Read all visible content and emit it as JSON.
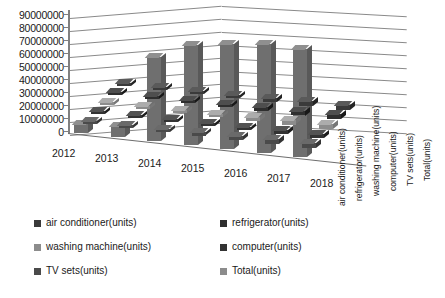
{
  "chart_data": {
    "type": "bar",
    "title": "",
    "subtitle": "",
    "xlabel": "",
    "ylabel": "",
    "zlabel": "",
    "categories": [
      "2012",
      "2013",
      "2014",
      "2015",
      "2016",
      "2017",
      "2018"
    ],
    "ylim": [
      0,
      90000000
    ],
    "ytick_step": 10000000,
    "yticks": [
      "90000000",
      "80000000",
      "70000000",
      "60000000",
      "50000000",
      "40000000",
      "30000000",
      "20000000",
      "10000000",
      "0"
    ],
    "grid": true,
    "legend_position": "bottom",
    "three_d": true,
    "depth_axis_labels": [
      "air conditioner(units)",
      "refrigerator(units)",
      "washing machine(units)",
      "computer(units)",
      "TV sets(units)",
      "Total(units)"
    ],
    "series": [
      {
        "name": "air conditioner(units)",
        "color": "#3a3a3a",
        "values": [
          1200000,
          1500000,
          1900000,
          2300000,
          2800000,
          3400000,
          3900000
        ]
      },
      {
        "name": "refrigerator(units)",
        "color": "#2e2e2e",
        "values": [
          1500000,
          1800000,
          2200000,
          2600000,
          3000000,
          3500000,
          3800000
        ]
      },
      {
        "name": "washing machine(units)",
        "color": "#8c8c8c",
        "values": [
          1300000,
          1600000,
          2000000,
          2400000,
          2900000,
          3300000,
          3600000
        ]
      },
      {
        "name": "computer(units)",
        "color": "#333333",
        "values": [
          1100000,
          1400000,
          1800000,
          2100000,
          2500000,
          2900000,
          3200000
        ]
      },
      {
        "name": "TV sets(units)",
        "color": "#4a4a4a",
        "values": [
          1400000,
          1700000,
          2100000,
          2500000,
          3000000,
          3400000,
          3700000
        ]
      },
      {
        "name": "Total(units)",
        "color": "#6f6f6f",
        "values": [
          6500000,
          8000000,
          63000000,
          75000000,
          79000000,
          82000000,
          81000000
        ]
      }
    ]
  },
  "legend": {
    "items": [
      {
        "label": "air conditioner(units)",
        "color": "#3a3a3a"
      },
      {
        "label": "refrigerator(units)",
        "color": "#2e2e2e"
      },
      {
        "label": "washing machine(units)",
        "color": "#8c8c8c"
      },
      {
        "label": "computer(units)",
        "color": "#333333"
      },
      {
        "label": "TV sets(units)",
        "color": "#4a4a4a"
      },
      {
        "label": "Total(units)",
        "color": "#8c8c8c"
      }
    ]
  },
  "colors": {
    "background": "#ffffff",
    "axis": "#808080",
    "grid": "#8a8a8a",
    "text": "#1a1a1a"
  }
}
